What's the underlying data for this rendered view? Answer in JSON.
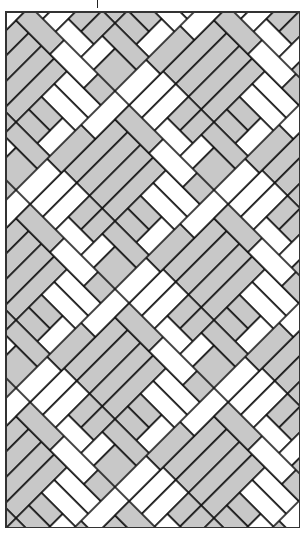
{
  "figure": {
    "kind": "decorative basket-weave / herringbone tiling pattern",
    "tick_mark": "|",
    "colors": {
      "light_brick": "#ffffff",
      "dark_brick": "#c8c8c8",
      "outline": "#111111",
      "frame": "#333333"
    },
    "rotation_deg": 45,
    "block": {
      "description": "large gray square made of 4 parallel planks, bordered by herringbone bricks",
      "planks_per_block": 4
    }
  }
}
